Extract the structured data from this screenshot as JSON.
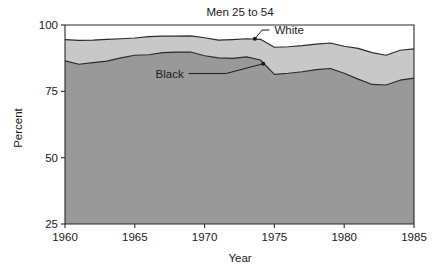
{
  "chart_data": {
    "type": "area",
    "title": "Men 25 to 54",
    "xlabel": "Year",
    "ylabel": "Percent",
    "xlim": [
      1960,
      1985
    ],
    "ylim": [
      25,
      100
    ],
    "xticks": [
      "1960",
      "1965",
      "1970",
      "1975",
      "1980",
      "1985"
    ],
    "xtick_values": [
      1960,
      1965,
      1970,
      1975,
      1980,
      1985
    ],
    "yticks": [
      "25",
      "50",
      "75",
      "100"
    ],
    "ytick_values": [
      25,
      50,
      75,
      100
    ],
    "grid": false,
    "legend_position": "inline-annotations",
    "stacking": "overlaid-bands",
    "x": [
      1960,
      1961,
      1962,
      1963,
      1964,
      1965,
      1966,
      1967,
      1968,
      1969,
      1970,
      1971,
      1972,
      1973,
      1974,
      1975,
      1976,
      1977,
      1978,
      1979,
      1980,
      1981,
      1982,
      1983,
      1984,
      1985
    ],
    "series": [
      {
        "name": "White",
        "color": "#c8c8c8",
        "label": "White",
        "values": [
          94.5,
          94.2,
          94.3,
          94.6,
          94.8,
          95.1,
          95.6,
          95.8,
          95.8,
          95.9,
          95.2,
          94.3,
          94.5,
          94.8,
          94.6,
          91.6,
          91.8,
          92.2,
          92.8,
          93.2,
          92.0,
          91.2,
          89.6,
          88.6,
          90.5,
          91.0
        ]
      },
      {
        "name": "Black",
        "color": "#999999",
        "label": "Black",
        "values": [
          86.5,
          85.2,
          85.8,
          86.4,
          87.6,
          88.6,
          88.8,
          89.6,
          89.8,
          89.8,
          88.4,
          87.6,
          87.4,
          88.0,
          86.8,
          81.4,
          81.8,
          82.4,
          83.2,
          83.6,
          81.8,
          79.6,
          77.6,
          77.4,
          79.2,
          80.0
        ]
      }
    ],
    "annotations": [
      {
        "text": "White",
        "x": 1975.0,
        "y": 96.6,
        "point_x": 1973.6,
        "point_y": 94.8
      },
      {
        "text": "Black",
        "x": 1968.5,
        "y": 80.2,
        "point_x": 1974.2,
        "point_y": 85.4
      }
    ]
  }
}
